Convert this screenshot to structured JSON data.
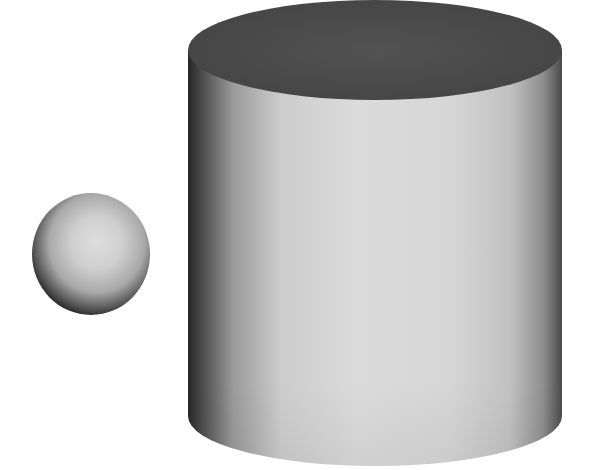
{
  "scene": {
    "description": "3D render of a small sphere next to a large cylinder on white background",
    "background": "#ffffff",
    "objects": [
      {
        "type": "sphere",
        "cx": 91,
        "cy": 254,
        "rx": 59,
        "ry": 61,
        "highlight": "#dcdcdc",
        "mid": "#b5b5b5",
        "shadow": "#1e1e1e"
      },
      {
        "type": "cylinder",
        "cx": 375,
        "rx": 187,
        "top_cy": 50,
        "bottom_cy": 416,
        "ry": 50,
        "top_color": "#4d4d4d",
        "side_light": "#dadada",
        "side_mid": "#c9c9c9",
        "side_dark": "#2a2a2a"
      }
    ]
  }
}
